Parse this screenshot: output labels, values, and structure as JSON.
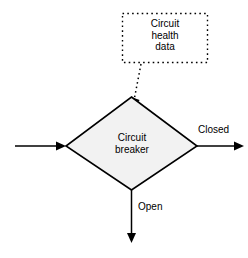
{
  "diagram": {
    "background_color": "#ffffff",
    "stroke_color": "#000000",
    "decision_fill_color": "#f2f2f2",
    "nodes": {
      "data_box": {
        "icon": "dotted-rectangle",
        "text_lines": [
          "Circuit",
          "health",
          "data"
        ],
        "text": "Circuit\nhealth\ndata",
        "border_style": "dotted"
      },
      "decision": {
        "icon": "diamond-shape",
        "text_lines": [
          "Circuit",
          "breaker"
        ],
        "text": "Circuit\nbreaker"
      }
    },
    "edges": {
      "input_arrow": {
        "icon": "arrow-right-icon",
        "label": ""
      },
      "data_feed_arrow": {
        "icon": "dotted-arrow-icon",
        "label": "",
        "style": "dotted"
      },
      "closed_arrow": {
        "icon": "arrow-right-icon",
        "label": "Closed"
      },
      "open_arrow": {
        "icon": "arrow-down-icon",
        "label": "Open"
      }
    }
  }
}
